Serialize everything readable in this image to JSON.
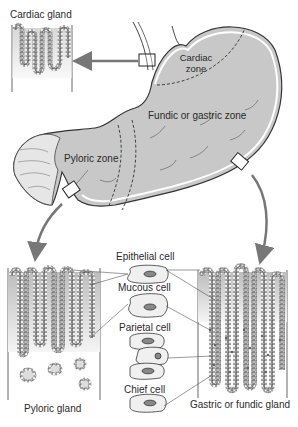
{
  "diagram": {
    "zones": {
      "cardiac": {
        "label_line1": "Cardiac",
        "label_line2": "zone"
      },
      "fundic": {
        "label": "Fundic or gastric zone"
      },
      "pyloric": {
        "label": "Pyloric zone"
      }
    },
    "glands": {
      "cardiac": {
        "label": "Cardiac gland"
      },
      "pyloric": {
        "label": "Pyloric gland"
      },
      "gastric": {
        "label": "Gastric or fundic gland"
      }
    },
    "cells": [
      {
        "label": "Epithelial cell"
      },
      {
        "label": "Mucous cell"
      },
      {
        "label": "Parietal cell"
      },
      {
        "label": "Chief cell"
      }
    ],
    "colors": {
      "stomach_fill": "#c8c8c8",
      "outline": "#333333",
      "arrow": "#777777",
      "gland_fill": "#d6d6d6"
    }
  }
}
